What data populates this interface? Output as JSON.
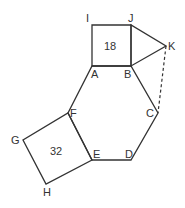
{
  "diagram": {
    "type": "geometry",
    "points": {
      "A": {
        "x": 92,
        "y": 66,
        "label": "A"
      },
      "B": {
        "x": 131,
        "y": 66,
        "label": "B"
      },
      "C": {
        "x": 158,
        "y": 113,
        "label": "C"
      },
      "D": {
        "x": 131,
        "y": 160,
        "label": "D"
      },
      "E": {
        "x": 92,
        "y": 160,
        "label": "E"
      },
      "F": {
        "x": 68,
        "y": 113,
        "label": "F"
      },
      "G": {
        "x": 23,
        "y": 140,
        "label": "G"
      },
      "H": {
        "x": 46,
        "y": 184,
        "label": "H"
      },
      "I": {
        "x": 92,
        "y": 25,
        "label": "I"
      },
      "J": {
        "x": 131,
        "y": 25,
        "label": "J"
      },
      "K": {
        "x": 166,
        "y": 46,
        "label": "K"
      }
    },
    "shapes": [
      {
        "name": "hexagon",
        "vertices": [
          "A",
          "B",
          "C",
          "D",
          "E",
          "F"
        ]
      },
      {
        "name": "square-ABJI",
        "vertices": [
          "A",
          "B",
          "J",
          "I"
        ],
        "area_label": "18"
      },
      {
        "name": "square-EFGH",
        "vertices": [
          "E",
          "F",
          "G",
          "H"
        ],
        "area_label": "32"
      },
      {
        "name": "triangle-BJK",
        "vertices": [
          "B",
          "J",
          "K"
        ]
      }
    ],
    "dashed_segments": [
      [
        "K",
        "C"
      ]
    ],
    "colors": {
      "stroke": "#333333",
      "background": "#ffffff"
    }
  }
}
